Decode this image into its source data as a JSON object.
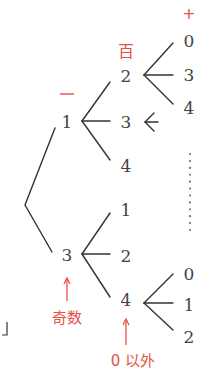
{
  "diagram": {
    "type": "tree",
    "labels": {
      "plus": "+",
      "hundred": "百",
      "minus": "一",
      "odd": "奇数",
      "nonzero": "0 以外",
      "bracket": "」"
    },
    "root_children": [
      "1",
      "3"
    ],
    "branch_1": {
      "node": "1",
      "children": [
        "2",
        "3",
        "4"
      ],
      "sub_of_2": [
        "0",
        "3",
        "4"
      ],
      "arrow_next_to_3": "<"
    },
    "branch_3": {
      "node": "3",
      "children": [
        "1",
        "2",
        "4"
      ],
      "sub_of_4": [
        "0",
        "1",
        "2"
      ]
    },
    "continuation": "⋮",
    "colors": {
      "text": "#444444",
      "line": "#333333",
      "accent": "#e8504a"
    }
  }
}
